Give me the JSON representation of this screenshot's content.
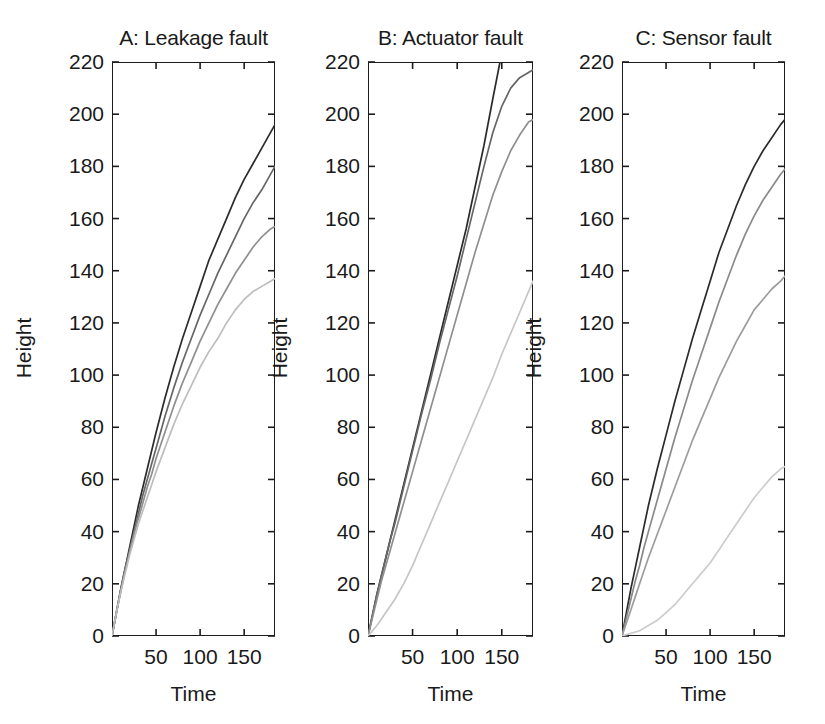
{
  "figure": {
    "background": "#ffffff",
    "axis_color": "#1c1c1c",
    "width": 825,
    "height": 724
  },
  "chart_data": {
    "type": "line",
    "title": "",
    "xlabel": "Time",
    "ylabel": "Height",
    "xlim": [
      0,
      185
    ],
    "ylim": [
      0,
      220
    ],
    "xticks": [
      50,
      100,
      150
    ],
    "xtick_labels": [
      "50",
      "100",
      "150"
    ],
    "yticks": [
      0,
      20,
      40,
      60,
      80,
      100,
      120,
      140,
      160,
      180,
      200,
      220
    ],
    "ytick_labels": [
      "0",
      "20",
      "40",
      "60",
      "80",
      "100",
      "120",
      "140",
      "160",
      "180",
      "200",
      "220"
    ],
    "grid": false,
    "legend": "none",
    "panels": [
      {
        "id": "A",
        "title": "A: Leakage fault",
        "series": [
          {
            "name": "curve-1",
            "color": "#2b2b2b",
            "x": [
              0,
              5,
              10,
              15,
              20,
              25,
              30,
              35,
              40,
              45,
              50,
              60,
              70,
              80,
              90,
              100,
              110,
              120,
              130,
              140,
              150,
              160,
              170,
              180,
              185
            ],
            "y": [
              0,
              9,
              18,
              26,
              34,
              42,
              50,
              57,
              64,
              71,
              78,
              91,
              103,
              114,
              124,
              134,
              144,
              152,
              160,
              168,
              175,
              181,
              187,
              193,
              196
            ]
          },
          {
            "name": "curve-2",
            "color": "#666666",
            "x": [
              0,
              5,
              10,
              15,
              20,
              25,
              30,
              35,
              40,
              45,
              50,
              60,
              70,
              80,
              90,
              100,
              110,
              120,
              130,
              140,
              150,
              160,
              170,
              180,
              185
            ],
            "y": [
              0,
              9,
              18,
              26,
              33,
              40,
              47,
              54,
              60,
              66,
              72,
              84,
              95,
              105,
              114,
              123,
              131,
              139,
              146,
              153,
              160,
              166,
              171,
              177,
              180
            ]
          },
          {
            "name": "curve-3",
            "color": "#8f8f8f",
            "x": [
              0,
              5,
              10,
              15,
              20,
              25,
              30,
              35,
              40,
              45,
              50,
              60,
              70,
              80,
              90,
              100,
              110,
              120,
              130,
              140,
              150,
              160,
              170,
              180,
              185
            ],
            "y": [
              0,
              9,
              17,
              25,
              32,
              39,
              45,
              51,
              57,
              62,
              68,
              78,
              88,
              97,
              105,
              113,
              120,
              127,
              133,
              139,
              144,
              149,
              153,
              156,
              157
            ]
          },
          {
            "name": "curve-4",
            "color": "#bdbdbd",
            "x": [
              0,
              5,
              10,
              15,
              20,
              25,
              30,
              35,
              40,
              45,
              50,
              60,
              70,
              80,
              90,
              100,
              110,
              120,
              130,
              140,
              150,
              160,
              170,
              180,
              185
            ],
            "y": [
              0,
              9,
              17,
              24,
              31,
              37,
              43,
              48,
              53,
              58,
              63,
              72,
              81,
              89,
              96,
              103,
              109,
              114,
              120,
              125,
              129,
              132,
              134,
              136,
              137
            ]
          }
        ]
      },
      {
        "id": "B",
        "title": "B: Actuator fault",
        "series": [
          {
            "name": "curve-1",
            "color": "#2b2b2b",
            "x": [
              0,
              5,
              10,
              15,
              20,
              25,
              30,
              40,
              50,
              60,
              70,
              80,
              90,
              100,
              110,
              120,
              130,
              140,
              148
            ],
            "y": [
              0,
              8,
              16,
              23,
              30,
              37,
              44,
              58,
              72,
              86,
              100,
              114,
              128,
              142,
              156,
              172,
              188,
              206,
              220
            ]
          },
          {
            "name": "curve-2",
            "color": "#666666",
            "x": [
              0,
              5,
              10,
              15,
              20,
              25,
              30,
              40,
              50,
              60,
              70,
              80,
              90,
              100,
              110,
              120,
              130,
              140,
              150,
              160,
              170,
              180,
              185
            ],
            "y": [
              0,
              8,
              16,
              23,
              30,
              37,
              43,
              57,
              71,
              85,
              98,
              112,
              125,
              138,
              152,
              166,
              180,
              193,
              203,
              210,
              214,
              216,
              217
            ]
          },
          {
            "name": "curve-3",
            "color": "#8f8f8f",
            "x": [
              0,
              5,
              10,
              15,
              20,
              25,
              30,
              40,
              50,
              60,
              70,
              80,
              90,
              100,
              110,
              120,
              130,
              140,
              150,
              160,
              170,
              180,
              185
            ],
            "y": [
              0,
              7,
              14,
              21,
              27,
              33,
              39,
              51,
              63,
              75,
              87,
              99,
              111,
              123,
              135,
              147,
              158,
              169,
              178,
              186,
              192,
              197,
              198
            ]
          },
          {
            "name": "curve-4",
            "color": "#c6c6c6",
            "x": [
              0,
              10,
              20,
              30,
              40,
              50,
              60,
              70,
              80,
              90,
              100,
              110,
              120,
              130,
              140,
              150,
              160,
              170,
              180,
              185
            ],
            "y": [
              0,
              4,
              9,
              14,
              20,
              27,
              35,
              43,
              51,
              59,
              67,
              75,
              83,
              91,
              99,
              108,
              116,
              124,
              132,
              136
            ]
          }
        ]
      },
      {
        "id": "C",
        "title": "C: Sensor fault",
        "series": [
          {
            "name": "curve-1",
            "color": "#2b2b2b",
            "x": [
              0,
              5,
              10,
              15,
              20,
              25,
              30,
              40,
              50,
              60,
              70,
              80,
              90,
              100,
              110,
              120,
              130,
              140,
              150,
              160,
              170,
              180,
              185
            ],
            "y": [
              0,
              9,
              18,
              26,
              34,
              42,
              50,
              64,
              77,
              90,
              102,
              114,
              125,
              136,
              147,
              156,
              165,
              173,
              180,
              186,
              191,
              196,
              198
            ]
          },
          {
            "name": "curve-2",
            "color": "#8a8a8a",
            "x": [
              0,
              5,
              10,
              15,
              20,
              25,
              30,
              40,
              50,
              60,
              70,
              80,
              90,
              100,
              110,
              120,
              130,
              140,
              150,
              160,
              170,
              180,
              185
            ],
            "y": [
              0,
              7,
              14,
              21,
              27,
              34,
              40,
              52,
              64,
              76,
              87,
              98,
              108,
              118,
              128,
              137,
              146,
              154,
              161,
              167,
              172,
              177,
              179
            ]
          },
          {
            "name": "curve-3",
            "color": "#9c9c9c",
            "x": [
              0,
              5,
              10,
              15,
              20,
              25,
              30,
              40,
              50,
              60,
              70,
              80,
              90,
              100,
              110,
              120,
              130,
              140,
              150,
              160,
              170,
              180,
              185
            ],
            "y": [
              0,
              5,
              10,
              15,
              20,
              25,
              30,
              39,
              48,
              57,
              66,
              75,
              83,
              91,
              99,
              106,
              113,
              119,
              125,
              129,
              133,
              136,
              138
            ]
          },
          {
            "name": "curve-4",
            "color": "#cccccc",
            "x": [
              0,
              10,
              20,
              30,
              40,
              50,
              60,
              70,
              80,
              90,
              100,
              110,
              120,
              130,
              140,
              150,
              160,
              170,
              180,
              185
            ],
            "y": [
              0,
              1,
              2,
              4,
              6,
              9,
              12,
              16,
              20,
              24,
              28,
              33,
              38,
              43,
              48,
              53,
              57,
              61,
              64,
              65
            ]
          }
        ]
      }
    ]
  }
}
